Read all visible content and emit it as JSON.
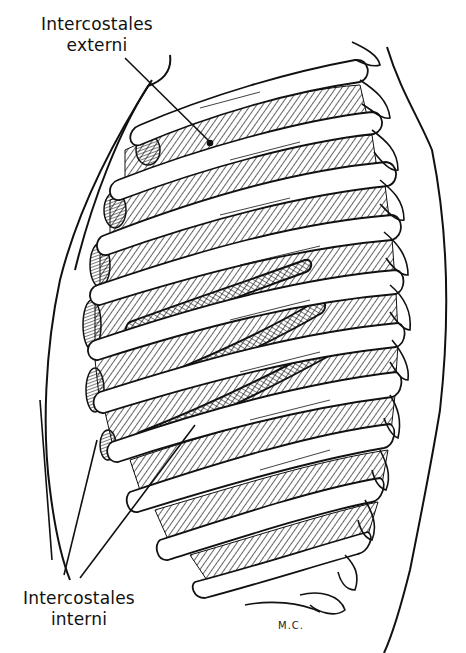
{
  "figure": {
    "type": "anatomical line illustration",
    "ink_color": "#111111",
    "background_color": "#ffffff"
  },
  "labels": {
    "top": {
      "line1": "Intercostales",
      "line2": "externi"
    },
    "bottom": {
      "line1": "Intercostales",
      "line2": "interni"
    }
  },
  "signature": "M.C."
}
